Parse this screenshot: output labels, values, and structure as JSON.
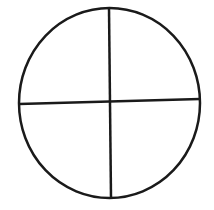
{
  "diagram": {
    "type": "circle divided into four quadrants",
    "stroke_color": "#1a1a1a",
    "background_color": "#ffffff",
    "shapes": [
      {
        "kind": "circle",
        "cx": 109.5,
        "cy": 103,
        "rx": 90.5,
        "ry": 95
      },
      {
        "kind": "line",
        "name": "vertical-divider",
        "x1": 109,
        "y1": 8,
        "x2": 111,
        "y2": 198
      },
      {
        "kind": "line",
        "name": "horizontal-divider",
        "x1": 19,
        "y1": 104,
        "x2": 200,
        "y2": 99
      }
    ]
  }
}
